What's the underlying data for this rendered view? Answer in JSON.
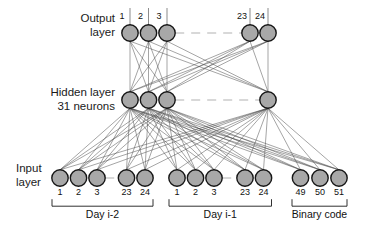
{
  "figure": {
    "type": "neural-network-architecture-diagram",
    "width": 368,
    "height": 236,
    "background_color": "#ffffff",
    "node_fill_color": "#a8a8a8",
    "node_stroke_color": "#161616",
    "edge_color": "#4a4a4a"
  },
  "layers": {
    "output": {
      "label_line1": "Output",
      "label_line2": "layer",
      "name": "Output layer",
      "node_count_shown": 5,
      "node_count_total": 24,
      "labels": [
        "1",
        "2",
        "3",
        "23",
        "24"
      ],
      "x_positions": [
        130,
        148.5,
        167,
        250,
        268
      ],
      "y": 33,
      "radius": 8.2,
      "has_ellipsis": true
    },
    "hidden": {
      "label_line1": "Hidden layer",
      "label_line2": "31 neurons",
      "name": "Hidden layer",
      "neuron_count": "31",
      "node_count_shown": 4,
      "x_positions": [
        130,
        148.5,
        167,
        268
      ],
      "y": 100,
      "radius": 8.2,
      "has_ellipsis": true
    },
    "input": {
      "label_line1": "Input",
      "label_line2": "layer",
      "name": "Input layer",
      "y": 178,
      "radius": 8.2,
      "groups": [
        {
          "id": "day-i-2",
          "caption": "Day  i-2",
          "labels": [
            "1",
            "2",
            "3",
            "23",
            "24"
          ],
          "x_positions": [
            60,
            78.5,
            97,
            126.5,
            145
          ],
          "has_ellipsis": true,
          "bracket_left": 52,
          "bracket_right": 153
        },
        {
          "id": "day-i-1",
          "caption": "Day  i-1",
          "labels": [
            "1",
            "2",
            "3",
            "23",
            "24"
          ],
          "x_positions": [
            177,
            195.5,
            214,
            245,
            263.5
          ],
          "has_ellipsis": true,
          "bracket_left": 169,
          "bracket_right": 271.5
        },
        {
          "id": "binary-code",
          "caption": "Binary code",
          "labels": [
            "49",
            "50",
            "51"
          ],
          "x_positions": [
            300.5,
            320,
            339
          ],
          "has_ellipsis": false,
          "bracket_left": 292,
          "bracket_right": 347
        }
      ]
    }
  }
}
